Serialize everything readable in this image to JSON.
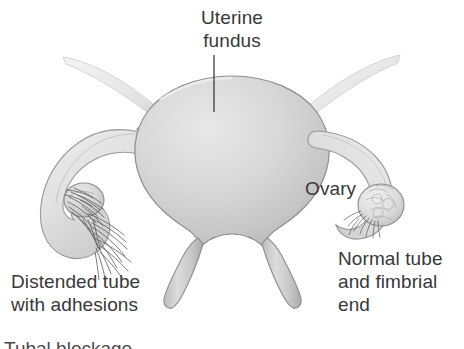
{
  "figure": {
    "type": "medical-anatomical-illustration",
    "background_color": "#ffffff",
    "text_color": "#383838",
    "organ_fill_light": "#e2e2e2",
    "organ_fill_mid": "#cfcfcf",
    "organ_fill_dark": "#b4b4b4",
    "organ_outline": "#8d8d8d",
    "adhesion_color": "#5a5a5a",
    "leader_line_color": "#3c3c3c"
  },
  "labels": {
    "uterine_fundus": "Uterine\nfundus",
    "ovary": "Ovary",
    "distended_tube": "Distended tube\nwith adhesions",
    "normal_tube": "Normal tube\nand fimbrial\nend"
  },
  "caption": {
    "cut_off_text": "Tubal blockage"
  },
  "parts": {
    "uterus_body": "uterus-fundus-body",
    "cervix_left_leg": "cervix-left-leg",
    "cervix_right_leg": "cervix-right-leg",
    "left_round_ligament": "left-round-ligament",
    "right_round_ligament": "right-round-ligament",
    "left_distended_tube": "left-distended-fallopian-tube",
    "left_ovary": "left-ovary",
    "left_adhesions": "left-adhesion-strands",
    "right_normal_tube": "right-normal-fallopian-tube",
    "right_ovary": "right-ovary",
    "right_fimbriae": "right-fimbrial-end"
  }
}
